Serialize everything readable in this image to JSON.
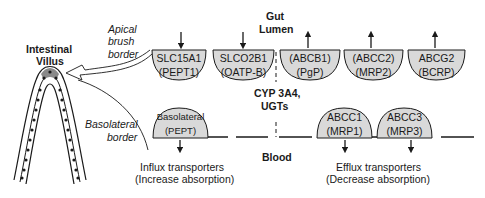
{
  "labels": {
    "villus_title_1": "Intestinal",
    "villus_title_2": "Villus",
    "apical_1": "Apical",
    "apical_2": "brush",
    "apical_3": "border",
    "basolateral_1": "Basolateral",
    "basolateral_2": "border",
    "gut_1": "Gut",
    "gut_2": "Lumen",
    "cyp_1": "CYP 3A4,",
    "cyp_2": "UGTs",
    "blood": "Blood",
    "influx_1": "Influx transporters",
    "influx_2": "(Increase absorption)",
    "efflux_1": "Efflux transporters",
    "efflux_2": "(Decrease absorption)"
  },
  "apical_transporters": [
    {
      "line1": "SLC15A1",
      "line2": "(PEPT1)",
      "direction": "in"
    },
    {
      "line1": "SLCO2B1",
      "line2": "(OATP-B)",
      "direction": "in"
    },
    {
      "line1": "(ABCB1)",
      "line2": "(PgP)",
      "direction": "out"
    },
    {
      "line1": "(ABCC2)",
      "line2": "(MRP2)",
      "direction": "out"
    },
    {
      "line1": "ABCG2",
      "line2": "(BCRP)",
      "direction": "out"
    }
  ],
  "basolateral_transporters": [
    {
      "line1": "Basolateral",
      "line2": "(PEPT)",
      "direction": "down"
    },
    {
      "line1": "ABCC1",
      "line2": "(MRP1)",
      "direction": "down"
    },
    {
      "line1": "ABCC3",
      "line2": "(MRP3)",
      "direction": "down"
    }
  ],
  "colors": {
    "transporter_fill": "#d9d9d9",
    "stroke": "#1a1a1a",
    "text": "#1a1a1a"
  }
}
